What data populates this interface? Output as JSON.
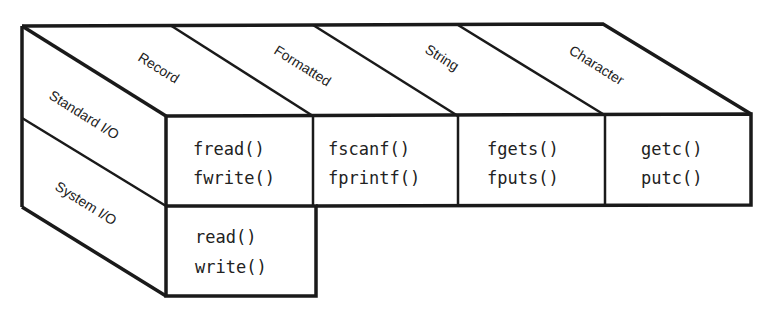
{
  "diagram": {
    "columns": [
      {
        "label": "Record"
      },
      {
        "label": "Formatted"
      },
      {
        "label": "String"
      },
      {
        "label": "Character"
      }
    ],
    "rows": [
      {
        "label": "Standard I/O"
      },
      {
        "label": "System I/O"
      }
    ],
    "cells": {
      "standard": [
        [
          "fread()",
          "fwrite()"
        ],
        [
          "fscanf()",
          "fprintf()"
        ],
        [
          "fgets()",
          "fputs()"
        ],
        [
          "getc()",
          "putc()"
        ]
      ],
      "system": [
        [
          "read()",
          "write()"
        ]
      ]
    }
  }
}
